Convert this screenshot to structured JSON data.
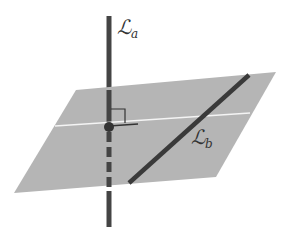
{
  "diagram": {
    "labels": {
      "line_a": "ℒ",
      "line_a_sub": "a",
      "line_b": "ℒ",
      "line_b_sub": "b"
    },
    "colors": {
      "plane": "#b3b3b3",
      "line": "#444444",
      "highlight": "#f2f2f2"
    }
  }
}
